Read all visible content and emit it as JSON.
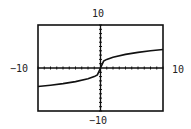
{
  "chart_data": {
    "type": "line",
    "title": "",
    "function": "y = 2*cbrt(x)",
    "xlabel": "",
    "ylabel": "",
    "xlim": [
      -10,
      10
    ],
    "ylim": [
      -10,
      10
    ],
    "xscale": 1,
    "yscale": 1,
    "grid": false,
    "legend": null,
    "tick_labels": {
      "xmin": "−10",
      "xmax": "10",
      "ymin": "−10",
      "ymax": "10"
    },
    "series": [
      {
        "name": "y1",
        "x": [
          -10,
          -8,
          -6,
          -4,
          -2,
          -1,
          -0.5,
          0,
          0.5,
          1,
          2,
          4,
          6,
          8,
          10
        ],
        "values": [
          -4.31,
          -4.0,
          -3.63,
          -3.17,
          -2.52,
          -2.0,
          -1.59,
          0,
          1.59,
          2.0,
          2.52,
          3.17,
          3.63,
          4.0,
          4.31
        ]
      }
    ]
  },
  "window": {
    "xmin": "−10",
    "xmax": "10",
    "ymin": "−10",
    "ymax": "10"
  },
  "colors": {
    "frame": "#111111",
    "curve": "#111111",
    "background": "#ffffff"
  }
}
